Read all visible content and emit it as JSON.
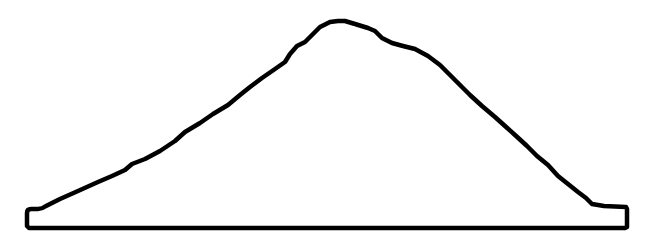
{
  "drawing": {
    "subject": "mound-outline",
    "stroke_color": "#000000",
    "fill_color": "#ffffff",
    "background": "#ffffff",
    "stroke_width": 4.5,
    "outline_path": "M 27 213 Q 27 209 31 209 L 38 209 Q 42 209 46 206 L 60 199 L 78 191 L 98 182 L 112 176 L 125 170 L 132 164 L 145 159 L 160 151 L 175 141 L 185 132 L 200 123 L 213 114 L 228 105 L 240 95 L 250 87 L 262 78 L 275 69 L 285 62 L 290 54 L 297 46 L 305 42 L 312 35 L 320 27 L 330 22 L 338 21 L 345 21 L 355 24 L 368 28 L 375 31 L 382 38 L 392 43 L 403 46 L 415 49 L 428 56 L 440 65 L 452 77 L 462 87 L 470 95 L 482 106 L 495 117 L 505 126 L 515 135 L 527 146 L 537 156 L 548 165 L 558 176 L 568 184 L 578 192 L 586 198 L 592 204 L 604 206 L 626 207 L 627 209 L 627 227 L 625 228 L 29 228 L 27 226 Z"
  }
}
